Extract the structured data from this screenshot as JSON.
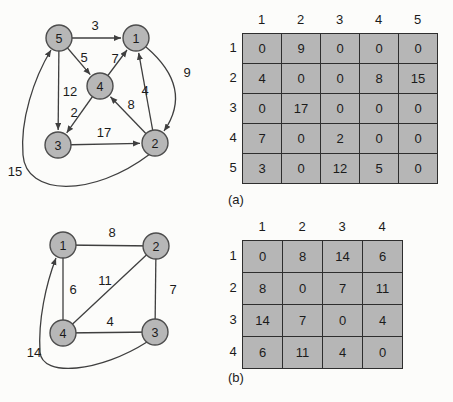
{
  "palette": {
    "background": "#fcfcfa",
    "node_fill": "#b7b7b7",
    "node_stroke": "#4d4d4d",
    "edge_stroke": "#3f3f3f",
    "cell_fill": "#b6b6b6",
    "cell_border": "#2e2e2e",
    "text": "#1b1b1b"
  },
  "figure_a": {
    "label": "(a)",
    "graph": {
      "directed": true,
      "node_radius": 13,
      "nodes": [
        {
          "id": "5",
          "x": 59,
          "y": 38
        },
        {
          "id": "1",
          "x": 136,
          "y": 38
        },
        {
          "id": "4",
          "x": 100,
          "y": 86
        },
        {
          "id": "3",
          "x": 58,
          "y": 145
        },
        {
          "id": "2",
          "x": 155,
          "y": 143
        }
      ],
      "edges": [
        {
          "from": "5",
          "to": "1",
          "weight": "3",
          "label_x": 95,
          "label_y": 25,
          "arrow": true
        },
        {
          "from": "5",
          "to": "4",
          "weight": "5",
          "label_x": 84,
          "label_y": 57,
          "arrow": true
        },
        {
          "from": "4",
          "to": "1",
          "weight": "7",
          "label_x": 115,
          "label_y": 58,
          "arrow": true
        },
        {
          "from": "2",
          "to": "1",
          "weight": "4",
          "label_x": 145,
          "label_y": 90,
          "arrow": true
        },
        {
          "from": "5",
          "to": "3",
          "weight": "12",
          "label_x": 70,
          "label_y": 91,
          "arrow": true
        },
        {
          "from": "4",
          "to": "3",
          "weight": "2",
          "label_x": 74,
          "label_y": 112,
          "arrow": true
        },
        {
          "from": "2",
          "to": "4",
          "weight": "8",
          "label_x": 131,
          "label_y": 104,
          "arrow": true
        },
        {
          "from": "3",
          "to": "2",
          "weight": "17",
          "label_x": 104,
          "label_y": 132,
          "arrow": true
        },
        {
          "from": "1",
          "to": "2",
          "weight": "9",
          "label_x": 187,
          "label_y": 72,
          "arrow": true,
          "path": "M 146 47 Q 194 88 164 131"
        },
        {
          "from": "2",
          "to": "5",
          "weight": "15",
          "label_x": 15,
          "label_y": 171,
          "arrow": true,
          "path": "M 150 154 C 92 198 26 196 23 155 C 20 120 34 78 51 50"
        }
      ]
    },
    "matrix": {
      "col_headers": [
        "1",
        "2",
        "3",
        "4",
        "5"
      ],
      "row_headers": [
        "1",
        "2",
        "3",
        "4",
        "5"
      ],
      "rows": [
        [
          "0",
          "9",
          "0",
          "0",
          "0"
        ],
        [
          "4",
          "0",
          "0",
          "8",
          "15"
        ],
        [
          "0",
          "17",
          "0",
          "0",
          "0"
        ],
        [
          "7",
          "0",
          "2",
          "0",
          "0"
        ],
        [
          "3",
          "0",
          "12",
          "5",
          "0"
        ]
      ]
    }
  },
  "figure_b": {
    "label": "(b)",
    "graph": {
      "directed": false,
      "node_radius": 13,
      "nodes": [
        {
          "id": "1",
          "x": 63,
          "y": 45
        },
        {
          "id": "2",
          "x": 156,
          "y": 46
        },
        {
          "id": "4",
          "x": 63,
          "y": 133
        },
        {
          "id": "3",
          "x": 155,
          "y": 132
        }
      ],
      "edges": [
        {
          "from": "1",
          "to": "2",
          "weight": "8",
          "label_x": 112,
          "label_y": 32,
          "arrow": false
        },
        {
          "from": "1",
          "to": "4",
          "weight": "6",
          "label_x": 73,
          "label_y": 89,
          "arrow": false
        },
        {
          "from": "2",
          "to": "4",
          "weight": "11",
          "label_x": 105,
          "label_y": 80,
          "arrow": false
        },
        {
          "from": "2",
          "to": "3",
          "weight": "7",
          "label_x": 173,
          "label_y": 89,
          "arrow": false
        },
        {
          "from": "4",
          "to": "3",
          "weight": "4",
          "label_x": 110,
          "label_y": 121,
          "arrow": false
        },
        {
          "from": "3",
          "to": "1",
          "weight": "14",
          "label_x": 34,
          "label_y": 152,
          "arrow": true,
          "path": "M 147 142 C 100 172 42 178 40 152 C 38 120 46 84 56 58"
        }
      ]
    },
    "matrix": {
      "col_headers": [
        "1",
        "2",
        "3",
        "4"
      ],
      "row_headers": [
        "1",
        "2",
        "3",
        "4"
      ],
      "rows": [
        [
          "0",
          "8",
          "14",
          "6"
        ],
        [
          "8",
          "0",
          "7",
          "11"
        ],
        [
          "14",
          "7",
          "0",
          "4"
        ],
        [
          "6",
          "11",
          "4",
          "0"
        ]
      ]
    }
  }
}
